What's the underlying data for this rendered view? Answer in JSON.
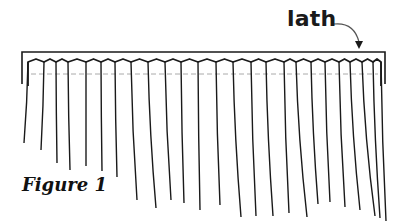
{
  "figure": {
    "label": "lath",
    "caption": "Figure 1",
    "colors": {
      "line": "#1a1a1a",
      "dashed": "#aaaaaa",
      "background": "#ffffff"
    },
    "lath_box": {
      "x": 22,
      "y": 52,
      "width": 363,
      "height": 32
    },
    "curtain": {
      "top_y": 62,
      "dashed_y": 74,
      "strands": [
        {
          "x": 28,
          "end_y": 143,
          "bend": -4
        },
        {
          "x": 44,
          "end_y": 150,
          "bend": -3
        },
        {
          "x": 56,
          "end_y": 163,
          "bend": 1
        },
        {
          "x": 68,
          "end_y": 170,
          "bend": 2
        },
        {
          "x": 86,
          "end_y": 166,
          "bend": 0
        },
        {
          "x": 101,
          "end_y": 171,
          "bend": 1
        },
        {
          "x": 115,
          "end_y": 177,
          "bend": 2
        },
        {
          "x": 131,
          "end_y": 200,
          "bend": 6
        },
        {
          "x": 148,
          "end_y": 208,
          "bend": 8
        },
        {
          "x": 165,
          "end_y": 200,
          "bend": 6
        },
        {
          "x": 181,
          "end_y": 203,
          "bend": 3
        },
        {
          "x": 198,
          "end_y": 210,
          "bend": 2
        },
        {
          "x": 216,
          "end_y": 205,
          "bend": 4
        },
        {
          "x": 233,
          "end_y": 217,
          "bend": 8
        },
        {
          "x": 251,
          "end_y": 216,
          "bend": 5
        },
        {
          "x": 266,
          "end_y": 216,
          "bend": 7
        },
        {
          "x": 284,
          "end_y": 213,
          "bend": 5
        },
        {
          "x": 296,
          "end_y": 217,
          "bend": 11
        },
        {
          "x": 311,
          "end_y": 204,
          "bend": 7
        },
        {
          "x": 325,
          "end_y": 202,
          "bend": 5
        },
        {
          "x": 339,
          "end_y": 207,
          "bend": 6
        },
        {
          "x": 350,
          "end_y": 210,
          "bend": 10
        },
        {
          "x": 362,
          "end_y": 216,
          "bend": 13
        },
        {
          "x": 373,
          "end_y": 218,
          "bend": 7
        },
        {
          "x": 381,
          "end_y": 221,
          "bend": 5
        }
      ]
    }
  }
}
